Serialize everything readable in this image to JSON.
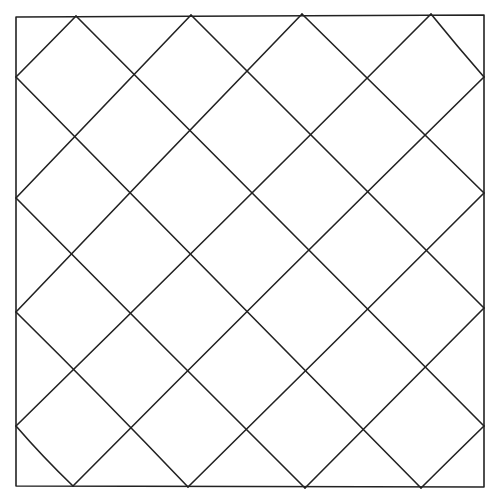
{
  "drawing": {
    "description": "Hand-drawn square filled with a diagonal diamond lattice",
    "stroke_color": "#222222",
    "background_color": "#ffffff",
    "frame": {
      "tl": [
        16,
        17
      ],
      "tr": [
        484,
        15
      ],
      "br": [
        484,
        487
      ],
      "bl": [
        16,
        486
      ]
    },
    "edge_vertices": {
      "top": [
        [
          76,
          16
        ],
        [
          191,
          15
        ],
        [
          302,
          14
        ],
        [
          431,
          14
        ]
      ],
      "bottom": [
        [
          73,
          486
        ],
        [
          188,
          487
        ],
        [
          305,
          488
        ],
        [
          421,
          488
        ]
      ],
      "left": [
        [
          16,
          77
        ],
        [
          16,
          198
        ],
        [
          16,
          312
        ],
        [
          16,
          426
        ]
      ],
      "right": [
        [
          484,
          77
        ],
        [
          484,
          193
        ],
        [
          484,
          308
        ],
        [
          484,
          426
        ]
      ]
    },
    "lines": [
      [
        [
          16,
          77
        ],
        [
          421,
          488
        ]
      ],
      [
        [
          16,
          198
        ],
        [
          305,
          488
        ]
      ],
      [
        [
          16,
          312
        ],
        [
          188,
          487
        ]
      ],
      [
        [
          16,
          426
        ],
        [
          73,
          486
        ]
      ],
      [
        [
          76,
          16
        ],
        [
          484,
          426
        ]
      ],
      [
        [
          191,
          15
        ],
        [
          484,
          308
        ]
      ],
      [
        [
          302,
          14
        ],
        [
          484,
          193
        ]
      ],
      [
        [
          431,
          14
        ],
        [
          484,
          77
        ]
      ],
      [
        [
          76,
          16
        ],
        [
          16,
          77
        ]
      ],
      [
        [
          191,
          15
        ],
        [
          16,
          198
        ]
      ],
      [
        [
          302,
          14
        ],
        [
          16,
          312
        ]
      ],
      [
        [
          431,
          14
        ],
        [
          16,
          426
        ]
      ],
      [
        [
          484,
          77
        ],
        [
          73,
          486
        ]
      ],
      [
        [
          484,
          193
        ],
        [
          188,
          487
        ]
      ],
      [
        [
          484,
          308
        ],
        [
          305,
          488
        ]
      ],
      [
        [
          484,
          426
        ],
        [
          421,
          488
        ]
      ]
    ]
  }
}
